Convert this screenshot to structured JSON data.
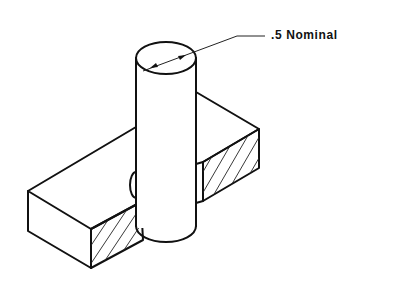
{
  "drawing": {
    "title": "Isometric view: cylinder pin through rectangular block",
    "dimension_label": ".5 Nominal",
    "colors": {
      "line": "#111111",
      "background": "#ffffff"
    }
  }
}
